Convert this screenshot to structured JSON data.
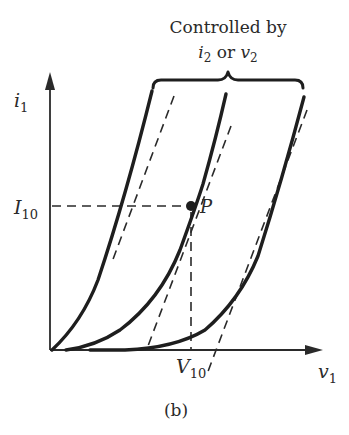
{
  "figure": {
    "caption": "(b)",
    "annotation": {
      "line1": "Controlled by",
      "line2_i": "i",
      "line2_i_sub": "2",
      "line2_or": " or ",
      "line2_v": "v",
      "line2_v_sub": "2"
    },
    "y_axis": {
      "symbol": "i",
      "subscript": "1"
    },
    "x_axis": {
      "symbol": "v",
      "subscript": "1"
    },
    "operating_point": {
      "label": "P",
      "current_label": "I",
      "current_sub": "10",
      "voltage_label": "V",
      "voltage_sub": "10"
    },
    "curves": [
      {
        "name": "characteristic-curve-1",
        "description": "leftmost i1-v1 curve with dashed tangent"
      },
      {
        "name": "characteristic-curve-2",
        "description": "middle curve passing through operating point P"
      },
      {
        "name": "characteristic-curve-3",
        "description": "rightmost curve with dashed tangent"
      }
    ],
    "colors": {
      "ink": "#1e1e1e",
      "background": "#ffffff"
    }
  }
}
